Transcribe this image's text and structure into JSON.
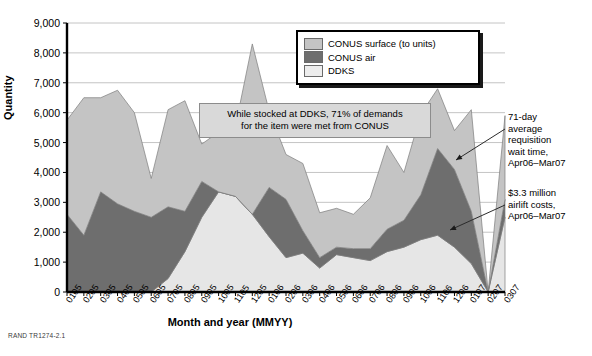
{
  "source_note": "RAND TR1274-2.1",
  "axes": {
    "ylabel": "Quantity",
    "xlabel": "Month and year (MMYY)",
    "yticks": [
      "9,000",
      "8,000",
      "7,000",
      "6,000",
      "5,000",
      "4,000",
      "3,000",
      "2,000",
      "1,000",
      "0"
    ]
  },
  "legend": {
    "items": [
      {
        "label": "CONUS surface (to units)",
        "color": "#c4c4c4"
      },
      {
        "label": "CONUS air",
        "color": "#6e6e6e"
      },
      {
        "label": "DDKS",
        "color": "#e6e6e6"
      }
    ]
  },
  "callout": {
    "line1": "While stocked at DDKS, 71% of demands",
    "line2": "for the item were met from CONUS"
  },
  "annotations": {
    "requisition_wait": "71-day\naverage\nrequisition\nwait time,\nApr06–Mar07",
    "airlift_cost": "$3.3 million\nairlift costs,\nApr06–Mar07"
  },
  "chart_data": {
    "type": "area",
    "stacked": true,
    "title": "",
    "xlabel": "Month and year (MMYY)",
    "ylabel": "Quantity",
    "ylim": [
      0,
      9000
    ],
    "ytick_step": 1000,
    "grid": true,
    "legend_position": "top-right",
    "categories": [
      "0105",
      "0205",
      "0305",
      "0405",
      "0505",
      "0605",
      "0705",
      "0805",
      "0905",
      "1005",
      "1105",
      "1205",
      "0106",
      "0206",
      "0306",
      "0406",
      "0506",
      "0606",
      "0706",
      "0806",
      "0906",
      "1006",
      "1106",
      "1206",
      "0107",
      "0207",
      "0307"
    ],
    "series": [
      {
        "name": "DDKS",
        "color": "#e6e6e6",
        "values": [
          0,
          0,
          0,
          0,
          0,
          0,
          450,
          1350,
          2500,
          3350,
          3200,
          2600,
          1850,
          1150,
          1300,
          800,
          1250,
          1150,
          1050,
          1350,
          1500,
          1750,
          1900,
          1500,
          950,
          0,
          2500
        ]
      },
      {
        "name": "CONUS air",
        "color": "#6e6e6e",
        "values": [
          2600,
          1900,
          3350,
          2950,
          2700,
          2500,
          2400,
          1350,
          1200,
          0,
          0,
          0,
          1650,
          1950,
          750,
          350,
          250,
          300,
          400,
          750,
          900,
          1500,
          2900,
          2600,
          1750,
          0,
          600
        ]
      },
      {
        "name": "CONUS surface (to units)",
        "color": "#c4c4c4",
        "values": [
          3150,
          4600,
          3150,
          3800,
          3300,
          1300,
          3250,
          3700,
          1250,
          2000,
          2350,
          5700,
          2550,
          1500,
          2250,
          1500,
          1300,
          1150,
          1700,
          2800,
          1600,
          2700,
          2000,
          1300,
          3400,
          0,
          2800
        ]
      }
    ],
    "totals": [
      5750,
      6500,
      6500,
      6750,
      6000,
      3800,
      6100,
      6400,
      4950,
      5350,
      5550,
      8300,
      6050,
      4600,
      4300,
      2650,
      2800,
      2600,
      3150,
      4900,
      4000,
      5950,
      6800,
      5400,
      6100,
      0,
      5900
    ]
  }
}
